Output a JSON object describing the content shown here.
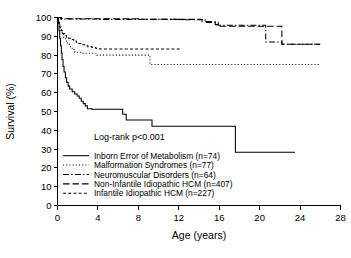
{
  "chart_data": {
    "type": "line",
    "title": "",
    "xlabel": "Age (years)",
    "ylabel": "Survival (%)",
    "xlim": [
      0,
      28
    ],
    "ylim": [
      0,
      100
    ],
    "xticks": [
      0,
      4,
      8,
      12,
      16,
      20,
      24,
      28
    ],
    "yticks": [
      0,
      10,
      20,
      30,
      40,
      50,
      60,
      70,
      80,
      90,
      100
    ],
    "xtick_labels": [
      "0",
      "4",
      "8",
      "12",
      "16",
      "20",
      "24",
      "28"
    ],
    "ytick_labels": [
      "0",
      "10",
      "20",
      "30",
      "40",
      "50",
      "60",
      "70",
      "80",
      "90",
      "100"
    ],
    "grid": false,
    "legend_position": "lower-left-inside",
    "annotations": [
      {
        "name": "log-rank-annotation",
        "text": "Log-rank p<0.001",
        "x": 3.6,
        "y": 35
      }
    ],
    "series": [
      {
        "name": "Inborn Error of Metabolism (n=74)",
        "label": "Inborn Error of Metabolism (n=74)",
        "group": "Inborn Error of Metabolism",
        "n": 74,
        "line_style": "solid",
        "color": "#000000",
        "final_survival": 28.3,
        "points": [
          [
            0.0,
            100.0
          ],
          [
            0.08,
            97.0
          ],
          [
            0.15,
            93.0
          ],
          [
            0.22,
            89.0
          ],
          [
            0.3,
            85.0
          ],
          [
            0.38,
            81.0
          ],
          [
            0.45,
            77.5
          ],
          [
            0.55,
            74.0
          ],
          [
            0.65,
            71.0
          ],
          [
            0.78,
            68.0
          ],
          [
            0.9,
            65.5
          ],
          [
            1.05,
            63.5
          ],
          [
            1.2,
            62.0
          ],
          [
            1.45,
            60.5
          ],
          [
            1.7,
            59.3
          ],
          [
            1.95,
            58.3
          ],
          [
            2.15,
            57.0
          ],
          [
            2.35,
            55.5
          ],
          [
            2.55,
            54.2
          ],
          [
            2.75,
            53.0
          ],
          [
            2.95,
            51.5
          ],
          [
            3.4,
            51.2
          ],
          [
            6.1,
            51.2
          ],
          [
            6.45,
            48.5
          ],
          [
            6.8,
            45.5
          ],
          [
            9.1,
            45.5
          ],
          [
            9.35,
            42.2
          ],
          [
            17.4,
            42.2
          ],
          [
            17.6,
            28.3
          ],
          [
            23.5,
            28.3
          ]
        ]
      },
      {
        "name": "Malformation Syndromes (n=77)",
        "label": "Malformation Syndromes (n=77)",
        "group": "Malformation Syndromes",
        "n": 77,
        "line_style": "dotted",
        "color": "#000000",
        "final_survival": 75.0,
        "points": [
          [
            0.0,
            100.0
          ],
          [
            0.12,
            97.0
          ],
          [
            0.25,
            94.5
          ],
          [
            0.4,
            92.0
          ],
          [
            0.6,
            89.5
          ],
          [
            0.8,
            87.5
          ],
          [
            1.0,
            86.0
          ],
          [
            1.2,
            84.5
          ],
          [
            1.45,
            83.0
          ],
          [
            1.7,
            81.5
          ],
          [
            2.3,
            81.0
          ],
          [
            3.6,
            81.0
          ],
          [
            3.9,
            80.0
          ],
          [
            8.9,
            80.0
          ],
          [
            9.15,
            75.0
          ],
          [
            26.0,
            75.0
          ]
        ]
      },
      {
        "name": "Neuromuscular Disorders (n=64)",
        "label": "Neuromuscular Disorders (n=64)",
        "group": "Neuromuscular Disorders",
        "n": 64,
        "line_style": "dashdot",
        "color": "#000000",
        "final_survival": 85.8,
        "points": [
          [
            0.0,
            100.0
          ],
          [
            0.3,
            99.2
          ],
          [
            1.0,
            99.2
          ],
          [
            4.0,
            99.0
          ],
          [
            8.0,
            99.0
          ],
          [
            12.0,
            98.8
          ],
          [
            14.2,
            98.8
          ],
          [
            14.6,
            97.4
          ],
          [
            15.6,
            97.4
          ],
          [
            15.9,
            95.9
          ],
          [
            20.3,
            95.9
          ],
          [
            20.6,
            87.0
          ],
          [
            22.0,
            87.0
          ],
          [
            22.2,
            85.8
          ],
          [
            26.0,
            85.8
          ]
        ]
      },
      {
        "name": "Non-Infantile Idiopathic HCM (n=407)",
        "label": "Non-Infantile Idiopathic HCM (n=407)",
        "group": "Non-Infantile Idiopathic HCM",
        "n": 407,
        "line_style": "longdash",
        "color": "#000000",
        "final_survival": 85.8,
        "points": [
          [
            0.0,
            100.0
          ],
          [
            0.4,
            99.3
          ],
          [
            3.0,
            99.3
          ],
          [
            8.0,
            99.1
          ],
          [
            12.0,
            99.0
          ],
          [
            13.9,
            99.0
          ],
          [
            14.3,
            97.8
          ],
          [
            15.2,
            97.8
          ],
          [
            15.6,
            96.2
          ],
          [
            16.0,
            95.3
          ],
          [
            21.9,
            95.3
          ],
          [
            22.2,
            85.8
          ],
          [
            26.0,
            85.8
          ]
        ]
      },
      {
        "name": "Infantile Idiopathic HCM (n=227)",
        "label": "Infantile Idiopathic HCM (n=227)",
        "group": "Infantile Idiopathic HCM",
        "n": 227,
        "line_style": "dashed",
        "color": "#000000",
        "final_survival": 83.2,
        "points": [
          [
            0.0,
            100.0
          ],
          [
            0.1,
            97.5
          ],
          [
            0.2,
            95.0
          ],
          [
            0.35,
            93.0
          ],
          [
            0.5,
            91.5
          ],
          [
            0.7,
            90.3
          ],
          [
            0.9,
            89.5
          ],
          [
            1.1,
            89.0
          ],
          [
            1.35,
            88.3
          ],
          [
            1.6,
            87.5
          ],
          [
            1.85,
            86.8
          ],
          [
            2.1,
            86.2
          ],
          [
            2.4,
            85.5
          ],
          [
            2.7,
            85.0
          ],
          [
            3.0,
            84.5
          ],
          [
            3.4,
            84.0
          ],
          [
            3.8,
            83.5
          ],
          [
            4.2,
            83.2
          ],
          [
            12.3,
            83.2
          ]
        ]
      }
    ],
    "legend_entries": [
      {
        "label": "Inborn Error of Metabolism (n=74)",
        "style": "solid"
      },
      {
        "label": "Malformation Syndromes (n=77)",
        "style": "dotted"
      },
      {
        "label": "Neuromuscular Disorders (n=64)",
        "style": "dashdot"
      },
      {
        "label": "Non-Infantile Idiopathic HCM (n=407)",
        "style": "longdash"
      },
      {
        "label": "Infantile Idiopathic HCM (n=227)",
        "style": "dashed"
      }
    ]
  }
}
